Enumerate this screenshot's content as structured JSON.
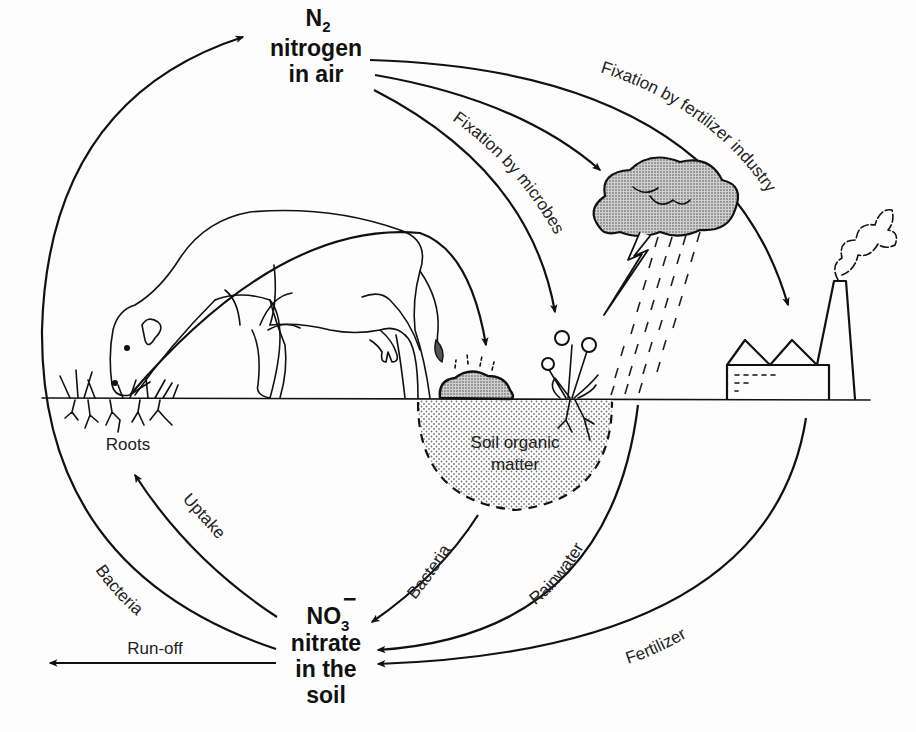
{
  "nodes": {
    "air": {
      "formula_main": "N",
      "formula_sub": "2",
      "line1": "nitrogen",
      "line2": "in air"
    },
    "soil": {
      "formula_main": "NO",
      "formula_sub": "3",
      "formula_sup": "−",
      "line1": "nitrate",
      "line2": "in the",
      "line3": "soil"
    },
    "organic_matter": {
      "line1": "Soil organic",
      "line2": "matter"
    },
    "roots": "Roots"
  },
  "processes": {
    "fixation_fertilizer_industry": "Fixation by fertilizer industry",
    "fixation_microbes": "Fixation by microbes",
    "bacteria_left": "Bacteria",
    "uptake": "Uptake",
    "bacteria_organic": "Bacteria",
    "rainwater": "Rainwater",
    "fertilizer": "Fertilizer",
    "run_off": "Run-off"
  },
  "illustrations": {
    "cow": "cow-grazing",
    "cloud": "storm-cloud",
    "lightning": "lightning-bolt",
    "rain": "rain",
    "plant": "flowering-plant",
    "factory": "factory",
    "manure": "manure-pile"
  },
  "colors": {
    "ink": "#111111",
    "background": "#fdfdfd",
    "stipple": "#9a9a9a"
  }
}
